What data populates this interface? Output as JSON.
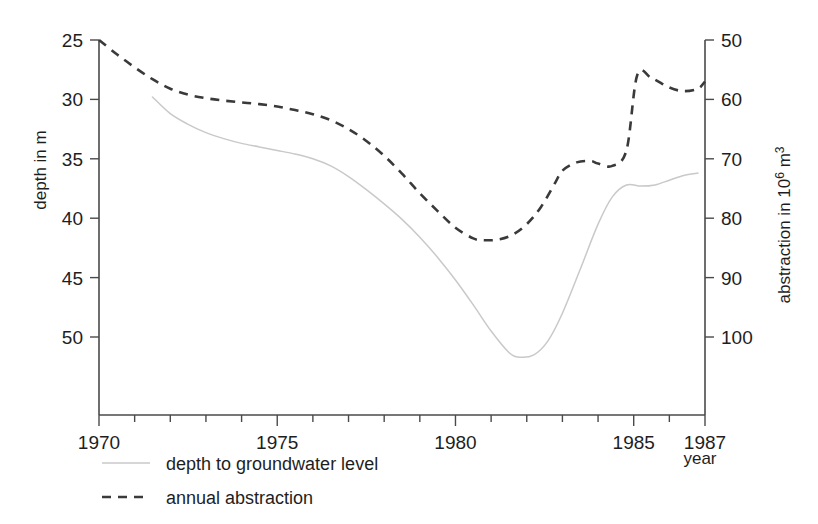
{
  "chart_data": {
    "type": "line",
    "title": "",
    "xlabel": "year",
    "ylabel": "depth in m",
    "y2label": "abstraction in 10⁶ m³",
    "xlim": [
      1970,
      1987
    ],
    "ylim": [
      25,
      53.5
    ],
    "y2lim": [
      50,
      104
    ],
    "y_inverted": true,
    "y2_inverted": true,
    "grid": false,
    "legend_position": "below-left",
    "x_ticks": [
      1970,
      1971,
      1972,
      1973,
      1974,
      1975,
      1976,
      1977,
      1978,
      1979,
      1980,
      1981,
      1982,
      1983,
      1984,
      1985,
      1986,
      1987
    ],
    "x_tick_labels": [
      "1970",
      "",
      "",
      "",
      "",
      "1975",
      "",
      "",
      "",
      "",
      "1980",
      "",
      "",
      "",
      "",
      "1985",
      "",
      "1987"
    ],
    "y_ticks": [
      25,
      30,
      35,
      40,
      45,
      50
    ],
    "y_tick_labels": [
      "25",
      "30",
      "35",
      "40",
      "45",
      "50"
    ],
    "y2_ticks": [
      50,
      60,
      70,
      80,
      90,
      100
    ],
    "y2_tick_labels": [
      "50",
      "60",
      "70",
      "80",
      "90",
      "100"
    ],
    "series": [
      {
        "name": "depth to groundwater level",
        "axis": "left",
        "style": "solid",
        "color": "#c9c9c9",
        "x": [
          1971.5,
          1972.0,
          1972.5,
          1973.0,
          1973.5,
          1974.0,
          1974.5,
          1975.0,
          1975.5,
          1976.0,
          1976.5,
          1977.0,
          1977.5,
          1978.0,
          1978.5,
          1979.0,
          1979.5,
          1980.0,
          1980.5,
          1981.0,
          1981.5,
          1981.8,
          1982.2,
          1982.6,
          1983.0,
          1983.5,
          1984.0,
          1984.4,
          1984.8,
          1985.2,
          1985.6,
          1986.0,
          1986.4,
          1986.8
        ],
        "y": [
          29.8,
          31.2,
          32.1,
          32.8,
          33.3,
          33.7,
          34.0,
          34.3,
          34.6,
          35.0,
          35.6,
          36.5,
          37.6,
          38.8,
          40.1,
          41.6,
          43.3,
          45.2,
          47.3,
          49.5,
          51.3,
          51.7,
          51.5,
          50.3,
          48.0,
          44.3,
          40.5,
          38.2,
          37.2,
          37.3,
          37.2,
          36.8,
          36.4,
          36.2
        ]
      },
      {
        "name": "annual abstraction",
        "axis": "right",
        "style": "dashed",
        "color": "#3a3a3a",
        "x": [
          1970.0,
          1970.5,
          1971.0,
          1971.5,
          1972.0,
          1972.5,
          1973.0,
          1973.5,
          1974.0,
          1974.5,
          1975.0,
          1975.5,
          1976.0,
          1976.5,
          1977.0,
          1977.5,
          1978.0,
          1978.5,
          1979.0,
          1979.5,
          1980.0,
          1980.5,
          1980.8,
          1981.2,
          1981.6,
          1982.0,
          1982.4,
          1982.8,
          1983.0,
          1983.4,
          1983.8,
          1984.0,
          1984.4,
          1984.8,
          1985.1,
          1985.5,
          1986.0,
          1986.4,
          1986.8,
          1987.0
        ],
        "y": [
          50.0,
          52.4,
          54.6,
          56.6,
          58.2,
          59.2,
          59.8,
          60.2,
          60.5,
          60.8,
          61.2,
          61.8,
          62.5,
          63.5,
          65.0,
          67.0,
          69.5,
          72.5,
          75.8,
          78.8,
          81.6,
          83.4,
          83.7,
          83.6,
          82.8,
          81.0,
          78.1,
          74.0,
          72.0,
          70.6,
          70.4,
          70.8,
          71.2,
          68.5,
          55.9,
          56.4,
          58.0,
          58.6,
          58.2,
          57.0
        ]
      }
    ],
    "annotations": []
  },
  "axes": {
    "left_title": "depth in m",
    "right_title_prefix": "abstraction in 10",
    "right_title_sup": "6",
    "right_title_suffix": " m",
    "right_title_sup2": "3",
    "x_title": "year"
  },
  "legend": {
    "items": [
      {
        "label": "depth to groundwater level",
        "style": "solid"
      },
      {
        "label": "annual abstraction",
        "style": "dashed"
      }
    ]
  }
}
